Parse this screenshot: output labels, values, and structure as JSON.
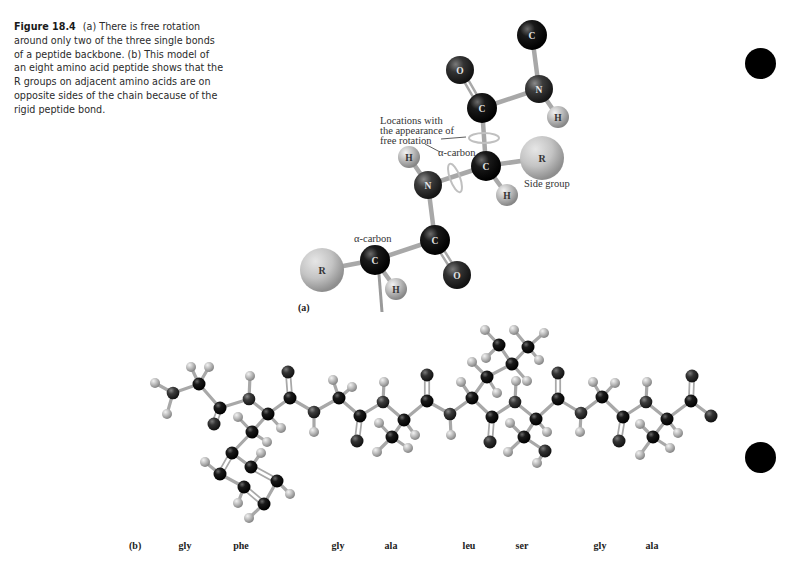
{
  "caption": {
    "figure_number": "Figure 18.4",
    "text": "(a) There is free rotation around only two of the three single bonds of a peptide backbone. (b) This model of an eight amino acid peptide shows that the R groups on adjacent amino acids are on opposite sides of the chain because of the rigid peptide bond."
  },
  "panel_a": {
    "label": "(a)",
    "annotations": {
      "rotation_line1": "Locations with",
      "rotation_line2": "the appearance of",
      "rotation_line3": "free rotation",
      "alpha_carbon_upper": "α-carbon",
      "alpha_carbon_lower": "α-carbon",
      "side_group": "Side group"
    },
    "atoms": [
      {
        "id": "c_top",
        "el": "C",
        "x": 532,
        "y": 35,
        "r": 15
      },
      {
        "id": "o_top",
        "el": "O",
        "x": 460,
        "y": 70,
        "r": 14
      },
      {
        "id": "n_top",
        "el": "N",
        "x": 539,
        "y": 89,
        "r": 14
      },
      {
        "id": "h_n_top",
        "el": "H",
        "x": 558,
        "y": 117,
        "r": 11
      },
      {
        "id": "c_carbonyl_top",
        "el": "C",
        "x": 482,
        "y": 108,
        "r": 15
      },
      {
        "id": "c_alpha",
        "el": "C",
        "x": 486,
        "y": 166,
        "r": 15
      },
      {
        "id": "r_upper",
        "el": "R",
        "x": 542,
        "y": 158,
        "r": 22
      },
      {
        "id": "h_alpha",
        "el": "H",
        "x": 507,
        "y": 195,
        "r": 11
      },
      {
        "id": "n_mid",
        "el": "N",
        "x": 428,
        "y": 185,
        "r": 14
      },
      {
        "id": "h_n_mid",
        "el": "H",
        "x": 409,
        "y": 157,
        "r": 11
      },
      {
        "id": "c_carbonyl_low",
        "el": "C",
        "x": 435,
        "y": 240,
        "r": 15
      },
      {
        "id": "o_low",
        "el": "O",
        "x": 457,
        "y": 275,
        "r": 14
      },
      {
        "id": "c_alpha_low",
        "el": "C",
        "x": 375,
        "y": 260,
        "r": 15
      },
      {
        "id": "r_lower",
        "el": "R",
        "x": 322,
        "y": 270,
        "r": 22
      },
      {
        "id": "h_alpha_low",
        "el": "H",
        "x": 396,
        "y": 289,
        "r": 11
      }
    ],
    "bonds": [
      [
        "c_top",
        "n_top",
        1
      ],
      [
        "n_top",
        "h_n_top",
        1
      ],
      [
        "n_top",
        "c_carbonyl_top",
        1
      ],
      [
        "c_carbonyl_top",
        "o_top",
        2
      ],
      [
        "c_carbonyl_top",
        "c_alpha",
        1
      ],
      [
        "c_alpha",
        "r_upper",
        1
      ],
      [
        "c_alpha",
        "h_alpha",
        1
      ],
      [
        "c_alpha",
        "n_mid",
        1
      ],
      [
        "n_mid",
        "h_n_mid",
        1
      ],
      [
        "n_mid",
        "c_carbonyl_low",
        1
      ],
      [
        "c_carbonyl_low",
        "o_low",
        2
      ],
      [
        "c_carbonyl_low",
        "c_alpha_low",
        1
      ],
      [
        "c_alpha_low",
        "r_lower",
        1
      ],
      [
        "c_alpha_low",
        "h_alpha_low",
        1
      ]
    ]
  },
  "panel_b": {
    "label": "(b)",
    "residues": [
      {
        "name": "gly",
        "x": 185
      },
      {
        "name": "phe",
        "x": 241
      },
      {
        "name": "gly",
        "x": 338
      },
      {
        "name": "ala",
        "x": 391
      },
      {
        "name": "leu",
        "x": 469
      },
      {
        "name": "ser",
        "x": 522
      },
      {
        "name": "gly",
        "x": 600
      },
      {
        "name": "ala",
        "x": 652
      }
    ],
    "atoms": [
      [
        "H",
        155,
        383
      ],
      [
        "N",
        173,
        393
      ],
      [
        "H",
        167,
        414
      ],
      [
        "H",
        191,
        367
      ],
      [
        "C",
        199,
        384
      ],
      [
        "H",
        209,
        367
      ],
      [
        "C",
        220,
        408
      ],
      [
        "O",
        214,
        424
      ],
      [
        "N",
        249,
        399
      ],
      [
        "H",
        250,
        376
      ],
      [
        "C",
        268,
        414
      ],
      [
        "H",
        281,
        428
      ],
      [
        "C",
        252,
        432
      ],
      [
        "H",
        238,
        417
      ],
      [
        "H",
        267,
        442
      ],
      [
        "C",
        232,
        453
      ],
      [
        "C",
        251,
        467
      ],
      [
        "H",
        261,
        453
      ],
      [
        "C",
        220,
        474
      ],
      [
        "H",
        205,
        462
      ],
      [
        "C",
        244,
        487
      ],
      [
        "H",
        238,
        503
      ],
      [
        "C",
        277,
        481
      ],
      [
        "H",
        290,
        494
      ],
      [
        "C",
        264,
        504
      ],
      [
        "H",
        249,
        518
      ],
      [
        "O",
        288,
        372
      ],
      [
        "C",
        290,
        398
      ],
      [
        "N",
        314,
        412
      ],
      [
        "H",
        314,
        432
      ],
      [
        "C",
        339,
        398
      ],
      [
        "H",
        333,
        380
      ],
      [
        "H",
        352,
        387
      ],
      [
        "C",
        360,
        416
      ],
      [
        "O",
        357,
        441
      ],
      [
        "N",
        383,
        402
      ],
      [
        "H",
        384,
        382
      ],
      [
        "C",
        404,
        420
      ],
      [
        "H",
        415,
        435
      ],
      [
        "C",
        392,
        437
      ],
      [
        "H",
        379,
        423
      ],
      [
        "H",
        377,
        452
      ],
      [
        "H",
        408,
        448
      ],
      [
        "O",
        427,
        375
      ],
      [
        "C",
        427,
        401
      ],
      [
        "N",
        450,
        414
      ],
      [
        "H",
        451,
        435
      ],
      [
        "C",
        472,
        398
      ],
      [
        "H",
        461,
        382
      ],
      [
        "C",
        487,
        377
      ],
      [
        "H",
        472,
        362
      ],
      [
        "H",
        497,
        393
      ],
      [
        "C",
        512,
        364
      ],
      [
        "H",
        527,
        381
      ],
      [
        "C",
        499,
        345
      ],
      [
        "H",
        485,
        330
      ],
      [
        "H",
        486,
        358
      ],
      [
        "C",
        528,
        347
      ],
      [
        "H",
        544,
        333
      ],
      [
        "H",
        539,
        360
      ],
      [
        "H",
        514,
        330
      ],
      [
        "C",
        492,
        417
      ],
      [
        "O",
        490,
        442
      ],
      [
        "N",
        515,
        402
      ],
      [
        "H",
        516,
        381
      ],
      [
        "C",
        536,
        419
      ],
      [
        "H",
        547,
        432
      ],
      [
        "C",
        524,
        437
      ],
      [
        "H",
        510,
        423
      ],
      [
        "H",
        508,
        452
      ],
      [
        "O",
        545,
        451
      ],
      [
        "H",
        537,
        463
      ],
      [
        "O",
        558,
        373
      ],
      [
        "C",
        558,
        399
      ],
      [
        "N",
        581,
        413
      ],
      [
        "H",
        580,
        432
      ],
      [
        "C",
        602,
        397
      ],
      [
        "H",
        593,
        382
      ],
      [
        "H",
        615,
        383
      ],
      [
        "C",
        623,
        417
      ],
      [
        "O",
        619,
        441
      ],
      [
        "N",
        646,
        402
      ],
      [
        "H",
        647,
        382
      ],
      [
        "C",
        667,
        419
      ],
      [
        "H",
        678,
        433
      ],
      [
        "C",
        653,
        437
      ],
      [
        "H",
        640,
        424
      ],
      [
        "H",
        640,
        455
      ],
      [
        "H",
        670,
        448
      ],
      [
        "C",
        691,
        401
      ],
      [
        "O",
        692,
        376
      ],
      [
        "O",
        711,
        416
      ]
    ],
    "bonds": [
      [
        0,
        1,
        1
      ],
      [
        1,
        2,
        1
      ],
      [
        1,
        4,
        1
      ],
      [
        3,
        4,
        1
      ],
      [
        4,
        5,
        1
      ],
      [
        4,
        6,
        1
      ],
      [
        6,
        7,
        2
      ],
      [
        6,
        8,
        1
      ],
      [
        8,
        9,
        1
      ],
      [
        8,
        10,
        1
      ],
      [
        10,
        11,
        1
      ],
      [
        10,
        12,
        1
      ],
      [
        12,
        13,
        1
      ],
      [
        12,
        14,
        1
      ],
      [
        12,
        15,
        1
      ],
      [
        15,
        16,
        1
      ],
      [
        16,
        17,
        1
      ],
      [
        15,
        18,
        2
      ],
      [
        18,
        19,
        1
      ],
      [
        18,
        20,
        1
      ],
      [
        20,
        21,
        1
      ],
      [
        16,
        22,
        2
      ],
      [
        22,
        23,
        1
      ],
      [
        22,
        24,
        1
      ],
      [
        20,
        24,
        2
      ],
      [
        24,
        25,
        1
      ],
      [
        10,
        27,
        1
      ],
      [
        27,
        26,
        2
      ],
      [
        27,
        28,
        1
      ],
      [
        28,
        29,
        1
      ],
      [
        28,
        30,
        1
      ],
      [
        30,
        31,
        1
      ],
      [
        30,
        32,
        1
      ],
      [
        30,
        33,
        1
      ],
      [
        33,
        34,
        2
      ],
      [
        33,
        35,
        1
      ],
      [
        35,
        36,
        1
      ],
      [
        35,
        37,
        1
      ],
      [
        37,
        38,
        1
      ],
      [
        37,
        39,
        1
      ],
      [
        39,
        40,
        1
      ],
      [
        39,
        41,
        1
      ],
      [
        39,
        42,
        1
      ],
      [
        37,
        44,
        1
      ],
      [
        44,
        43,
        2
      ],
      [
        44,
        45,
        1
      ],
      [
        45,
        46,
        1
      ],
      [
        45,
        47,
        1
      ],
      [
        47,
        48,
        1
      ],
      [
        47,
        49,
        1
      ],
      [
        49,
        50,
        1
      ],
      [
        49,
        51,
        1
      ],
      [
        49,
        52,
        1
      ],
      [
        52,
        53,
        1
      ],
      [
        52,
        54,
        1
      ],
      [
        54,
        55,
        1
      ],
      [
        54,
        56,
        1
      ],
      [
        52,
        57,
        1
      ],
      [
        57,
        58,
        1
      ],
      [
        57,
        59,
        1
      ],
      [
        57,
        60,
        1
      ],
      [
        47,
        61,
        1
      ],
      [
        61,
        62,
        2
      ],
      [
        61,
        63,
        1
      ],
      [
        63,
        64,
        1
      ],
      [
        63,
        65,
        1
      ],
      [
        65,
        66,
        1
      ],
      [
        65,
        67,
        1
      ],
      [
        67,
        68,
        1
      ],
      [
        67,
        69,
        1
      ],
      [
        67,
        70,
        1
      ],
      [
        70,
        71,
        1
      ],
      [
        65,
        73,
        1
      ],
      [
        73,
        72,
        2
      ],
      [
        73,
        74,
        1
      ],
      [
        74,
        75,
        1
      ],
      [
        74,
        76,
        1
      ],
      [
        76,
        77,
        1
      ],
      [
        76,
        78,
        1
      ],
      [
        76,
        79,
        1
      ],
      [
        79,
        80,
        2
      ],
      [
        79,
        81,
        1
      ],
      [
        81,
        82,
        1
      ],
      [
        81,
        83,
        1
      ],
      [
        83,
        84,
        1
      ],
      [
        83,
        85,
        1
      ],
      [
        85,
        86,
        1
      ],
      [
        85,
        87,
        1
      ],
      [
        85,
        88,
        1
      ],
      [
        83,
        89,
        1
      ],
      [
        89,
        90,
        2
      ],
      [
        89,
        91,
        1
      ]
    ]
  },
  "markers": [
    {
      "name": "margin-dot-top",
      "x": 760,
      "y": 63
    },
    {
      "name": "margin-dot-bottom",
      "x": 760,
      "y": 457
    }
  ],
  "colors": {
    "carbon": "#0d0d0d",
    "nitrogen": "#3a3a3a",
    "oxygen": "#2e2e2e",
    "hydrogen": "#b8b8b8",
    "r_group": "#c2c2c2",
    "bond": "#a8a8a8",
    "rotation_arrow": "#bdbdbd"
  }
}
